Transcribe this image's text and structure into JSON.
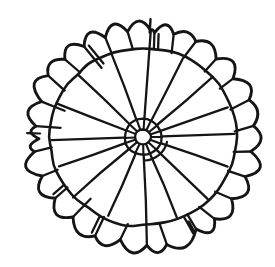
{
  "figure": {
    "background": "#ffffff",
    "ink": "#151515",
    "canvas": {
      "width": 275,
      "height": 267
    },
    "center": {
      "x": 143,
      "y": 137,
      "yscale": 0.96
    },
    "hub": {
      "r": 8.2,
      "stroke": 2.3,
      "wobble": 0.5,
      "points": 10
    },
    "ring": {
      "r": 19,
      "stroke": 2.3,
      "wobble": 0.9,
      "points": 14
    },
    "ring_arc": {
      "r": 24.5,
      "a0": 12,
      "a1": 86,
      "stroke": 2.2
    },
    "inner_circle": {
      "r": 93,
      "stroke": 2.6,
      "wobble": 1.6,
      "points": 40
    },
    "spokes": {
      "start_r": 19.5,
      "end_r": 92,
      "end_jitter": 3,
      "stroke": 2.3,
      "angles": [
        -86,
        -64,
        -42,
        -20,
        -2,
        20,
        45,
        68,
        88,
        113,
        138,
        160,
        178,
        -158,
        -135,
        -110
      ],
      "extended": [
        -86,
        88
      ],
      "extended_r": 113
    },
    "hub_spokes": {
      "start_r": 8.4,
      "end_r": 18.6,
      "stroke": 2.1
    },
    "band": {
      "notch_r": 111,
      "notch_jitter": 3.5,
      "bump_r": 120.5,
      "bump_jitter": 2.5,
      "stroke": 2.9,
      "divider_stroke": 2.3,
      "dividers": [
        -174,
        -160,
        -146,
        -134,
        -122,
        -110,
        -98,
        -84,
        -74,
        -62,
        -48,
        -34,
        -20,
        -6,
        8,
        22,
        36,
        50,
        61,
        78,
        102,
        115,
        130,
        144,
        158,
        172
      ],
      "doubles": [
        -122,
        -84,
        61,
        115,
        144
      ],
      "double_offset": 4.2,
      "overshoot": [
        -174,
        -160,
        -122,
        130
      ],
      "overshoot_len": 9,
      "extra_anchors": [
        {
          "angle": 179,
          "r": 104
        }
      ]
    },
    "ticks": [
      {
        "angle": -86.5,
        "r0": 109,
        "r1": 123,
        "w": 2.4
      },
      {
        "angle": 63,
        "r0": 100,
        "r1": 112,
        "w": 4.0
      },
      {
        "angle": 182,
        "r0": 103,
        "r1": 116,
        "w": 2.2
      }
    ],
    "seed": 7
  }
}
